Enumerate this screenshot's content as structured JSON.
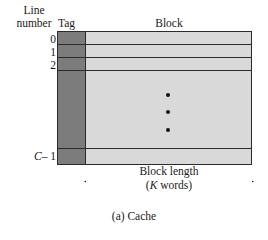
{
  "figure": {
    "caption": "(a) Cache",
    "line_number_label": "Line\nnumber",
    "columns": {
      "tag_header": "Tag",
      "block_header": "Block"
    },
    "rows": [
      {
        "label": "0",
        "label_italic": ""
      },
      {
        "label": "1",
        "label_italic": ""
      },
      {
        "label": "2",
        "label_italic": ""
      },
      {
        "label": "",
        "label_italic": ""
      },
      {
        "label": "– 1",
        "label_italic": "C"
      }
    ],
    "ellipsis": {
      "name": "vertical-ellipsis",
      "dot_count": 3
    },
    "dimension": {
      "line1": "Block length",
      "line2_prefix": "(",
      "line2_italic": "K",
      "line2_suffix": " words)",
      "arrow_style": "double-headed-horizontal"
    },
    "colors": {
      "tag_fill": "#7c7c7c",
      "block_fill": "#d9d9d9",
      "stroke": "#2b2b2b",
      "text": "#1a1a1a",
      "background": "#ffffff"
    }
  }
}
